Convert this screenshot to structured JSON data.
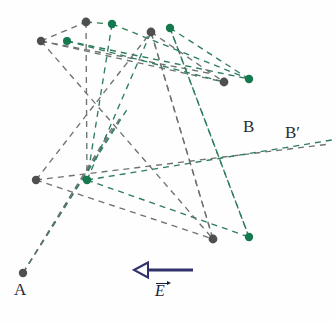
{
  "figure": {
    "width": 335,
    "height": 323,
    "background_color": "#fefefe"
  },
  "labels": {
    "a": "A",
    "b": "B",
    "b_prime": "B′",
    "e_field": "E"
  },
  "colors": {
    "gray_node": "#4f4f52",
    "green_node": "#15784f",
    "gray_ray": "#6d7370",
    "green_ray": "#2e7d5c",
    "arrow": "#31316b",
    "label_text": "#2b2b33"
  },
  "field_arrow": {
    "name": "E-field vector",
    "direction": "left",
    "x_start": 193,
    "x_end": 134,
    "y": 270,
    "shaft_width": 3,
    "head_length": 14,
    "head_width": 15,
    "color": "#31316b"
  },
  "nodes": [
    {
      "id": "n1",
      "x": 41,
      "y": 41,
      "color": "gray",
      "r": 4.2
    },
    {
      "id": "n2",
      "x": 67,
      "y": 41,
      "color": "green",
      "r": 4.0
    },
    {
      "id": "n3",
      "x": 86,
      "y": 22,
      "color": "gray",
      "r": 4.4
    },
    {
      "id": "n4",
      "x": 112,
      "y": 24,
      "color": "green",
      "r": 4.2
    },
    {
      "id": "n5",
      "x": 151,
      "y": 32,
      "color": "gray",
      "r": 4.4
    },
    {
      "id": "n6",
      "x": 170,
      "y": 28,
      "color": "green",
      "r": 4.2
    },
    {
      "id": "n7",
      "x": 224,
      "y": 82,
      "color": "gray",
      "r": 4.4
    },
    {
      "id": "n8",
      "x": 249,
      "y": 79,
      "color": "green",
      "r": 4.2
    },
    {
      "id": "n9",
      "x": 36,
      "y": 180,
      "color": "gray",
      "r": 4.2
    },
    {
      "id": "n10",
      "x": 87,
      "y": 180,
      "color": "green",
      "r": 4.2
    },
    {
      "id": "n11",
      "x": 213,
      "y": 239,
      "color": "gray",
      "r": 4.4
    },
    {
      "id": "n12",
      "x": 249,
      "y": 237,
      "color": "green",
      "r": 4.2
    },
    {
      "id": "n13",
      "x": 23,
      "y": 273,
      "color": "gray",
      "r": 4.2
    }
  ],
  "rays": [
    {
      "id": "r1",
      "from": [
        41,
        41
      ],
      "to": [
        86,
        22
      ],
      "color": "gray"
    },
    {
      "id": "r2",
      "from": [
        86,
        22
      ],
      "to": [
        112,
        24
      ],
      "color": "green"
    },
    {
      "id": "r3",
      "from": [
        41,
        41
      ],
      "to": [
        224,
        82
      ],
      "color": "gray"
    },
    {
      "id": "r4",
      "from": [
        41,
        41
      ],
      "to": [
        213,
        74
      ],
      "color": "gray"
    },
    {
      "id": "r5",
      "from": [
        67,
        41
      ],
      "to": [
        249,
        79
      ],
      "color": "green"
    },
    {
      "id": "r6",
      "from": [
        67,
        41
      ],
      "to": [
        224,
        82
      ],
      "color": "green"
    },
    {
      "id": "r7",
      "from": [
        112,
        24
      ],
      "to": [
        249,
        79
      ],
      "color": "green"
    },
    {
      "id": "r8",
      "from": [
        170,
        28
      ],
      "to": [
        249,
        79
      ],
      "color": "green"
    },
    {
      "id": "r9",
      "from": [
        151,
        32
      ],
      "to": [
        224,
        82
      ],
      "color": "gray"
    },
    {
      "id": "r10",
      "from": [
        151,
        32
      ],
      "to": [
        213,
        239
      ],
      "color": "gray"
    },
    {
      "id": "r11",
      "from": [
        170,
        28
      ],
      "to": [
        249,
        237
      ],
      "color": "green"
    },
    {
      "id": "r12",
      "from": [
        86,
        22
      ],
      "to": [
        87,
        180
      ],
      "color": "gray"
    },
    {
      "id": "r13",
      "from": [
        112,
        24
      ],
      "to": [
        87,
        180
      ],
      "color": "green"
    },
    {
      "id": "r14",
      "from": [
        36,
        180
      ],
      "to": [
        151,
        32
      ],
      "color": "gray"
    },
    {
      "id": "r15",
      "from": [
        36,
        180
      ],
      "to": [
        330,
        144
      ],
      "color": "gray"
    },
    {
      "id": "r16",
      "from": [
        87,
        180
      ],
      "to": [
        332,
        140
      ],
      "color": "green"
    },
    {
      "id": "r17",
      "from": [
        36,
        180
      ],
      "to": [
        213,
        239
      ],
      "color": "gray"
    },
    {
      "id": "r18",
      "from": [
        87,
        180
      ],
      "to": [
        249,
        237
      ],
      "color": "green"
    },
    {
      "id": "r19",
      "from": [
        23,
        273
      ],
      "to": [
        120,
        118
      ],
      "color": "gray"
    },
    {
      "id": "r20",
      "from": [
        23,
        273
      ],
      "to": [
        128,
        108
      ],
      "color": "green"
    },
    {
      "id": "r21",
      "from": [
        23,
        273
      ],
      "to": [
        112,
        128
      ],
      "color": "gray"
    },
    {
      "id": "r22",
      "from": [
        87,
        180
      ],
      "to": [
        151,
        32
      ],
      "color": "green"
    },
    {
      "id": "r23",
      "from": [
        213,
        239
      ],
      "to": [
        151,
        32
      ],
      "color": "gray"
    },
    {
      "id": "r24",
      "from": [
        249,
        237
      ],
      "to": [
        170,
        28
      ],
      "color": "green"
    },
    {
      "id": "r25",
      "from": [
        41,
        41
      ],
      "to": [
        213,
        239
      ],
      "color": "gray"
    }
  ]
}
